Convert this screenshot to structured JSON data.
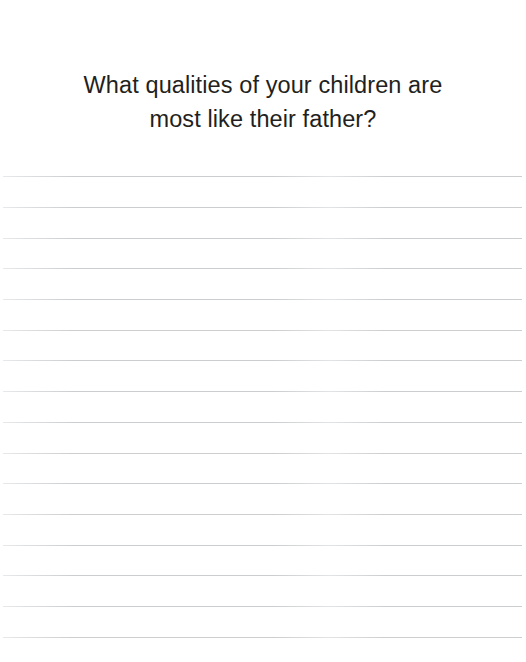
{
  "page": {
    "background_color": "#ffffff",
    "width": 526,
    "height": 662
  },
  "prompt": {
    "text": "What qualities of your children are most like their father?",
    "line_1": "What qualities of your children are most",
    "line_2": "like their father?",
    "color": "#231f20",
    "alignment": "center"
  },
  "writing_area": {
    "label": "ruled-answer-lines",
    "line_color": "#c9cbcd",
    "line_count": 16,
    "line_spacing_px": 30.7,
    "first_line_y": 176,
    "left_inset_px": 3,
    "right_inset_px": 4,
    "lines": [
      {
        "index": 1,
        "y": 176
      },
      {
        "index": 2,
        "y": 207
      },
      {
        "index": 3,
        "y": 238
      },
      {
        "index": 4,
        "y": 268
      },
      {
        "index": 5,
        "y": 299
      },
      {
        "index": 6,
        "y": 330
      },
      {
        "index": 7,
        "y": 360
      },
      {
        "index": 8,
        "y": 391
      },
      {
        "index": 9,
        "y": 422
      },
      {
        "index": 10,
        "y": 453
      },
      {
        "index": 11,
        "y": 483
      },
      {
        "index": 12,
        "y": 514
      },
      {
        "index": 13,
        "y": 545
      },
      {
        "index": 14,
        "y": 575
      },
      {
        "index": 15,
        "y": 606
      },
      {
        "index": 16,
        "y": 637
      }
    ]
  }
}
